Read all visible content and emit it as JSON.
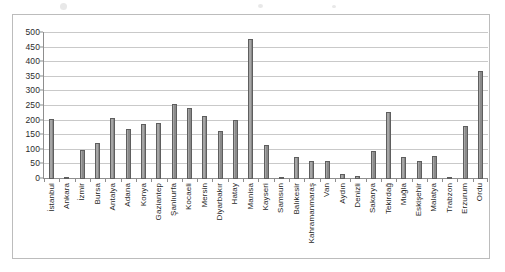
{
  "chart_data": {
    "type": "bar",
    "title": "",
    "subtitle": "",
    "xlabel": "",
    "ylabel": "",
    "ylim": [
      0,
      500
    ],
    "ytick_step": 50,
    "yticks": [
      500,
      450,
      400,
      350,
      300,
      250,
      200,
      150,
      100,
      50,
      0
    ],
    "grid": true,
    "legend": false,
    "legend_position": "none",
    "bar_color": "#8a8a8a",
    "bar_border_color": "#5e5e5e",
    "categories": [
      "İstanbul",
      "Ankara",
      "İzmir",
      "Bursa",
      "Antalya",
      "Adana",
      "Konya",
      "Gaziantep",
      "Şanlıurfa",
      "Kocaeli",
      "Mersin",
      "Diyarbakır",
      "Hatay",
      "Manisa",
      "Kayseri",
      "Samsun",
      "Balıkesir",
      "Kahramanmaraş",
      "Van",
      "Aydın",
      "Denizli",
      "Sakarya",
      "Tekirdağ",
      "Muğla",
      "Eskişehir",
      "Malatya",
      "Trabzon",
      "Erzurum",
      "Ordu"
    ],
    "values": [
      205,
      3,
      100,
      125,
      208,
      170,
      187,
      192,
      258,
      243,
      215,
      163,
      203,
      480,
      118,
      5,
      77,
      62,
      60,
      18,
      10,
      97,
      230,
      75,
      62,
      80,
      2,
      180,
      370
    ],
    "series": [
      {
        "name": "",
        "values": [
          205,
          3,
          100,
          125,
          208,
          170,
          187,
          192,
          258,
          243,
          215,
          163,
          203,
          480,
          118,
          5,
          77,
          62,
          60,
          18,
          10,
          97,
          230,
          75,
          62,
          80,
          2,
          180,
          370
        ]
      }
    ]
  },
  "frame": {
    "border_color": "#bcbcbc",
    "background": "#ffffff"
  }
}
